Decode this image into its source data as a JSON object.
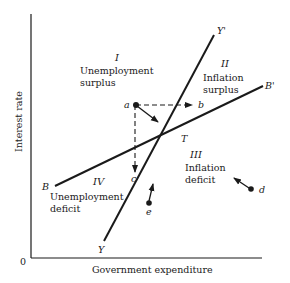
{
  "diagram": {
    "axes": {
      "x_label": "Government expenditure",
      "y_label": "Interest rate",
      "origin_label": "0"
    },
    "lines": {
      "YY": {
        "start_label": "Y",
        "end_label": "Y'"
      },
      "BB": {
        "start_label": "B",
        "end_label": "B'"
      }
    },
    "equilibrium_label": "T",
    "regions": [
      {
        "numeral": "I",
        "line1": "Unemployment",
        "line2": "surplus"
      },
      {
        "numeral": "II",
        "line1": "Inflation",
        "line2": "surplus"
      },
      {
        "numeral": "III",
        "line1": "Inflation",
        "line2": "deficit"
      },
      {
        "numeral": "IV",
        "line1": "Unemployment",
        "line2": "deficit"
      }
    ],
    "points": {
      "a": "a",
      "b": "b",
      "c": "c",
      "d": "d",
      "e": "e"
    },
    "colors": {
      "ink": "#1a1a1a",
      "background": "#ffffff"
    }
  }
}
